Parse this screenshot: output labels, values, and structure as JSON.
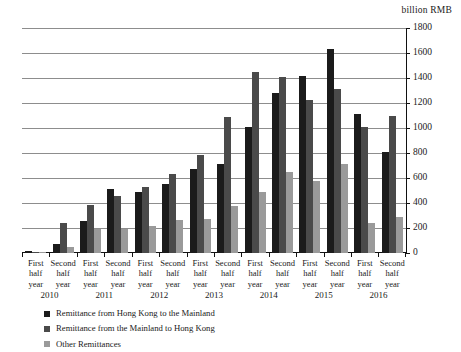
{
  "chart_data": {
    "type": "bar",
    "title": "",
    "unit_label": "billion RMB",
    "xlabel": "",
    "ylabel": "billion RMB",
    "ylim": [
      0,
      1800
    ],
    "ytick_step": 200,
    "yticks": [
      0,
      200,
      400,
      600,
      800,
      1000,
      1200,
      1400,
      1600,
      1800
    ],
    "grid": true,
    "legend_position": "below-left",
    "y_axis_side": "right",
    "categories": [
      "First half year",
      "Second half year",
      "First half year",
      "Second half year",
      "First half year",
      "Second half year",
      "First half year",
      "Second half year",
      "First half year",
      "Second half year",
      "First half year",
      "Second half year",
      "First half year",
      "Second half year"
    ],
    "category_lines": [
      [
        "First",
        "half",
        "year"
      ],
      [
        "Second",
        "half",
        "year"
      ],
      [
        "First",
        "half",
        "year"
      ],
      [
        "Second",
        "half",
        "year"
      ],
      [
        "First",
        "half",
        "year"
      ],
      [
        "Second",
        "half",
        "year"
      ],
      [
        "First",
        "half",
        "year"
      ],
      [
        "Second",
        "half",
        "year"
      ],
      [
        "First",
        "half",
        "year"
      ],
      [
        "Second",
        "half",
        "year"
      ],
      [
        "First",
        "half",
        "year"
      ],
      [
        "Second",
        "half",
        "year"
      ],
      [
        "First",
        "half",
        "year"
      ],
      [
        "Second",
        "half",
        "year"
      ]
    ],
    "years": [
      "2010",
      "2011",
      "2012",
      "2013",
      "2014",
      "2015",
      "2016"
    ],
    "series": [
      {
        "name": "Remittance from Hong Kong to the Mainland",
        "color": "#1b1b1b",
        "values": [
          20,
          75,
          260,
          510,
          490,
          555,
          670,
          710,
          1010,
          1280,
          1415,
          1630,
          1115,
          810
        ]
      },
      {
        "name": "Remittance from the Mainland to Hong Kong",
        "color": "#4a4a4a",
        "values": [
          10,
          240,
          385,
          455,
          530,
          635,
          785,
          1090,
          1450,
          1410,
          1225,
          1315,
          1010,
          1095
        ]
      },
      {
        "name": "Other Remittances",
        "color": "#9a9a9a",
        "values": [
          8,
          50,
          190,
          190,
          215,
          265,
          270,
          375,
          485,
          650,
          575,
          715,
          240,
          285
        ]
      }
    ]
  }
}
